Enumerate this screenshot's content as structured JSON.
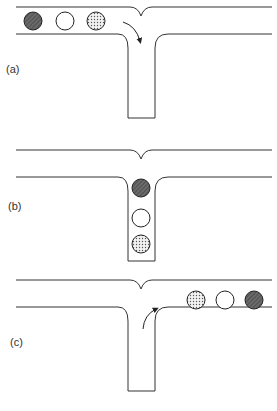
{
  "panels": [
    {
      "label": "(a)",
      "label_pos": {
        "x": 6,
        "y": 63
      },
      "offset_y": 0,
      "balls": [
        {
          "cx": 33,
          "cy": 21,
          "fill": "dark-hatched"
        },
        {
          "cx": 65,
          "cy": 21,
          "fill": "white"
        },
        {
          "cx": 96,
          "cy": 21,
          "fill": "dotted"
        }
      ],
      "arrow": "turn-into-stem"
    },
    {
      "label": "(b)",
      "label_pos": {
        "x": 8,
        "y": 206
      },
      "offset_y": 143,
      "balls": [
        {
          "cx": 141,
          "cy": 188,
          "fill": "dark-hatched"
        },
        {
          "cx": 141,
          "cy": 218,
          "fill": "white"
        },
        {
          "cx": 141,
          "cy": 244,
          "fill": "dotted"
        }
      ],
      "arrow": "none"
    },
    {
      "label": "(c)",
      "label_pos": {
        "x": 10,
        "y": 340
      },
      "offset_y": 273,
      "balls": [
        {
          "cx": 196,
          "cy": 300,
          "fill": "dotted"
        },
        {
          "cx": 225,
          "cy": 300,
          "fill": "white"
        },
        {
          "cx": 254,
          "cy": 300,
          "fill": "dark-hatched"
        }
      ],
      "arrow": "exit-stem-right"
    }
  ],
  "colors": {
    "line": "#333333",
    "dark": "#555555",
    "background": "#ffffff"
  }
}
